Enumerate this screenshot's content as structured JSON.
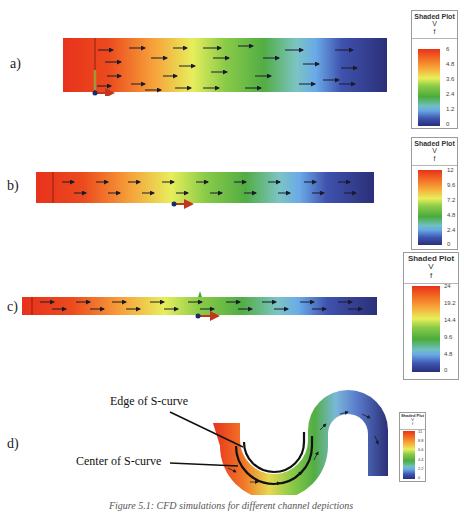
{
  "panels": [
    {
      "label": "a)",
      "legend": {
        "title": "Shaded Plot",
        "variable": "V",
        "unit": "f",
        "ticks": [
          "6",
          "4.8",
          "3.6",
          "2.4",
          "1.2",
          "0"
        ]
      }
    },
    {
      "label": "b)",
      "legend": {
        "title": "Shaded Plot",
        "variable": "V",
        "unit": "f",
        "ticks": [
          "12",
          "9.6",
          "7.2",
          "4.8",
          "2.4",
          "0"
        ]
      }
    },
    {
      "label": "c)",
      "legend": {
        "title": "Shaded Plot",
        "variable": "V",
        "unit": "f",
        "ticks": [
          "24",
          "19.2",
          "14.4",
          "9.6",
          "4.8",
          "0"
        ]
      }
    },
    {
      "label": "d)",
      "legend": {
        "title": "Shaded Plot",
        "variable": "V",
        "unit": "f",
        "ticks": [
          "11",
          "8.8",
          "6.6",
          "4.4",
          "2.2",
          "0"
        ]
      },
      "annotations": {
        "edge": "Edge of S-curve",
        "center": "Center of S-curve"
      }
    }
  ],
  "colors": {
    "high": "#e8321c",
    "mid_high": "#f7a83a",
    "mid": "#e8ef5a",
    "mid_low": "#4aab3c",
    "low_light": "#68a8e6",
    "low": "#2a2f7a"
  },
  "caption": "Figure 5.1: CFD simulations for different channel depictions"
}
